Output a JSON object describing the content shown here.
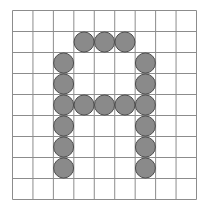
{
  "diagram": {
    "grid": {
      "cols": 9,
      "rows": 9
    },
    "colors": {
      "background": "#ffffff",
      "grid_line": "#8c8c8c",
      "dot_fill": "#8a8a8a",
      "dot_stroke": "#4d4d4d"
    },
    "dots": [
      {
        "col": 3,
        "row": 1
      },
      {
        "col": 4,
        "row": 1
      },
      {
        "col": 5,
        "row": 1
      },
      {
        "col": 2,
        "row": 2
      },
      {
        "col": 6,
        "row": 2
      },
      {
        "col": 2,
        "row": 3
      },
      {
        "col": 6,
        "row": 3
      },
      {
        "col": 2,
        "row": 4
      },
      {
        "col": 3,
        "row": 4
      },
      {
        "col": 4,
        "row": 4
      },
      {
        "col": 5,
        "row": 4
      },
      {
        "col": 6,
        "row": 4
      },
      {
        "col": 2,
        "row": 5
      },
      {
        "col": 6,
        "row": 5
      },
      {
        "col": 2,
        "row": 6
      },
      {
        "col": 6,
        "row": 6
      },
      {
        "col": 2,
        "row": 7
      },
      {
        "col": 6,
        "row": 7
      }
    ]
  }
}
